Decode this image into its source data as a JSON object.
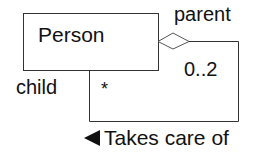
{
  "diagram": {
    "type": "UML class diagram (reflexive aggregation)",
    "class": {
      "name": "Person"
    },
    "association": {
      "name": "Takes care of",
      "direction_icon": "triangle-left-icon",
      "parent_role": "parent",
      "parent_multiplicity": "0..2",
      "child_role": "child",
      "child_multiplicity": "*",
      "aggregation": "hollow-diamond"
    }
  }
}
